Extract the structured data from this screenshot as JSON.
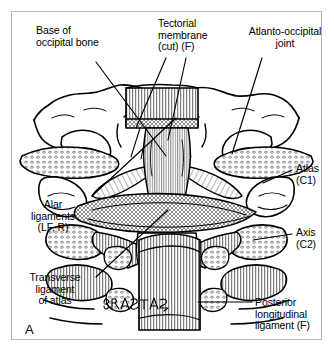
{
  "figure": {
    "panel_letter": "A",
    "artist_signature": "Batista",
    "background_color": "#ffffff",
    "border_color": "#b4b4b4",
    "ink_color": "#000000"
  },
  "labels": {
    "base_occipital": "Base of\noccipital bone",
    "tectorial_membrane": "Tectorial\nmembrane\n(cut) (F)",
    "atlanto_occipital": "Atlanto-occipital\njoint",
    "atlas": "Atlas\n(C1)",
    "axis": "Axis\n(C2)",
    "alar_ligaments": "Alar\nligaments\n(LF, R)",
    "transverse_ligament": "Transverse\nligament\nof atlas",
    "posterior_longitudinal": "Posterior\nlongitudinal\nligament (F)"
  }
}
